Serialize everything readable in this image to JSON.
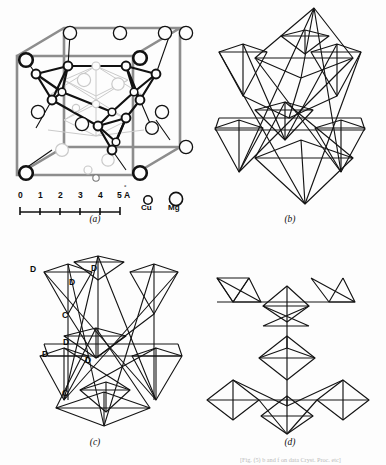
{
  "figure": {
    "background_color": "#fdfdfd",
    "ink_color": "#101010",
    "frame_color": "#8d8d8d",
    "panels": [
      {
        "id": "a",
        "caption": "(a)",
        "description": "unit-cell-of-mgcu2"
      },
      {
        "id": "b",
        "caption": "(b)",
        "description": "tetrahedral-framework"
      },
      {
        "id": "c",
        "caption": "(c)",
        "description": "labelled-tetrahedra-network"
      },
      {
        "id": "d",
        "caption": "(d)",
        "description": "linked-polyhedra"
      }
    ]
  },
  "panel_a": {
    "caption": "(a)",
    "scale_bar": {
      "ticks": [
        "0",
        "1",
        "2",
        "3",
        "4",
        "5"
      ],
      "unit": "Å",
      "unit_ring": "°",
      "unit_letter": "A"
    },
    "legend": [
      {
        "symbol": "Cu",
        "label": "Cu",
        "radius_px": 4.2,
        "role": "small-circle"
      },
      {
        "symbol": "Mg",
        "label": "Mg",
        "radius_px": 6.6,
        "role": "large-circle"
      }
    ]
  },
  "panel_b": {
    "caption": "(b)"
  },
  "panel_c": {
    "caption": "(c)",
    "vertex_labels": [
      {
        "text": "D",
        "x": 32,
        "y": 270
      },
      {
        "text": "D",
        "x": 90,
        "y": 270
      },
      {
        "text": "D",
        "x": 68,
        "y": 282
      },
      {
        "text": "C",
        "x": 62,
        "y": 313
      },
      {
        "text": "D",
        "x": 62,
        "y": 341
      },
      {
        "text": "D",
        "x": 42,
        "y": 352
      },
      {
        "text": "D",
        "x": 85,
        "y": 358
      },
      {
        "text": "C",
        "x": 62,
        "y": 391
      }
    ]
  },
  "panel_d": {
    "caption": "(d)"
  },
  "footnote": {
    "text": "[Fig. (5) b and f  on data Cryst. Proc. etc]"
  }
}
